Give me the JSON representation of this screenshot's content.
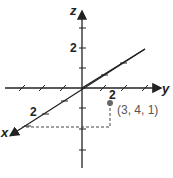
{
  "diagram": {
    "type": "3d-coordinate-axes",
    "axes": {
      "x": {
        "label": "x",
        "tick_label": "2"
      },
      "y": {
        "label": "y",
        "tick_label": "2"
      },
      "z": {
        "label": "z",
        "tick_label": "2"
      }
    },
    "point": {
      "label": "(3, 4, 1)",
      "x": 3,
      "y": 4,
      "z": 1,
      "color": "#666666"
    },
    "colors": {
      "axes": "#222222",
      "dashed": "#444444"
    }
  }
}
